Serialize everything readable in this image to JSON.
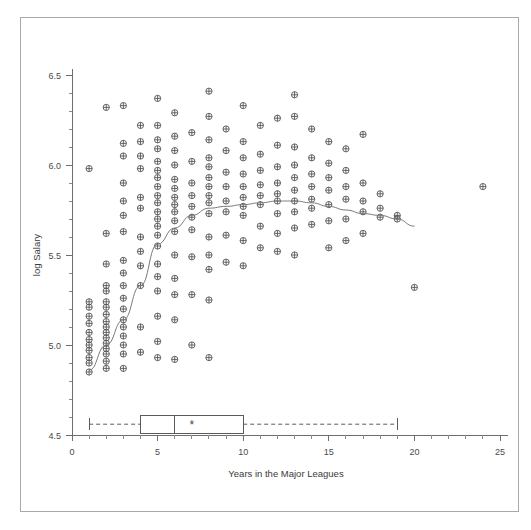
{
  "chart_data": {
    "type": "scatter",
    "title": "",
    "xlabel": "Years in the Major Leagues",
    "ylabel": "log Salary",
    "xlim": [
      0,
      25
    ],
    "ylim": [
      4.5,
      6.5
    ],
    "x_ticks": [
      0,
      5,
      10,
      15,
      20,
      25
    ],
    "x_tick_labels": [
      "0",
      "5",
      "10",
      "15",
      "20",
      "25"
    ],
    "x_minor_tick_step": 1,
    "y_ticks": [
      4.5,
      5.0,
      5.5,
      6.0,
      6.5
    ],
    "y_tick_labels": [
      "4.5",
      "5.0",
      "5.5",
      "6.0",
      "6.5"
    ],
    "y_minor_tick_step": 0.1,
    "grid": false,
    "legend": "none",
    "marker_style": "circle-with-cross",
    "points": [
      [
        1,
        5.98
      ],
      [
        1,
        5.24
      ],
      [
        1,
        5.21
      ],
      [
        1,
        5.16
      ],
      [
        1,
        5.12
      ],
      [
        1,
        5.07
      ],
      [
        1,
        5.03
      ],
      [
        1,
        5.0
      ],
      [
        1,
        4.97
      ],
      [
        1,
        4.93
      ],
      [
        1,
        4.9
      ],
      [
        1,
        4.85
      ],
      [
        2,
        6.32
      ],
      [
        2,
        5.62
      ],
      [
        2,
        5.45
      ],
      [
        2,
        5.33
      ],
      [
        2,
        5.3
      ],
      [
        2,
        5.24
      ],
      [
        2,
        5.21
      ],
      [
        2,
        5.17
      ],
      [
        2,
        5.13
      ],
      [
        2,
        5.1
      ],
      [
        2,
        5.07
      ],
      [
        2,
        5.04
      ],
      [
        2,
        5.01
      ],
      [
        2,
        4.98
      ],
      [
        2,
        4.95
      ],
      [
        2,
        4.91
      ],
      [
        2,
        4.87
      ],
      [
        3,
        6.33
      ],
      [
        3,
        6.12
      ],
      [
        3,
        6.05
      ],
      [
        3,
        5.9
      ],
      [
        3,
        5.8
      ],
      [
        3,
        5.72
      ],
      [
        3,
        5.63
      ],
      [
        3,
        5.47
      ],
      [
        3,
        5.4
      ],
      [
        3,
        5.33
      ],
      [
        3,
        5.26
      ],
      [
        3,
        5.2
      ],
      [
        3,
        5.14
      ],
      [
        3,
        5.1
      ],
      [
        3,
        5.05
      ],
      [
        3,
        5.0
      ],
      [
        3,
        4.95
      ],
      [
        3,
        4.87
      ],
      [
        4,
        6.22
      ],
      [
        4,
        6.13
      ],
      [
        4,
        6.05
      ],
      [
        4,
        5.98
      ],
      [
        4,
        5.82
      ],
      [
        4,
        5.76
      ],
      [
        4,
        5.6
      ],
      [
        4,
        5.52
      ],
      [
        4,
        5.44
      ],
      [
        4,
        5.33
      ],
      [
        4,
        5.1
      ],
      [
        4,
        4.96
      ],
      [
        5,
        6.37
      ],
      [
        5,
        6.22
      ],
      [
        5,
        6.14
      ],
      [
        5,
        6.09
      ],
      [
        5,
        6.02
      ],
      [
        5,
        5.97
      ],
      [
        5,
        5.93
      ],
      [
        5,
        5.88
      ],
      [
        5,
        5.83
      ],
      [
        5,
        5.79
      ],
      [
        5,
        5.74
      ],
      [
        5,
        5.7
      ],
      [
        5,
        5.66
      ],
      [
        5,
        5.61
      ],
      [
        5,
        5.55
      ],
      [
        5,
        5.45
      ],
      [
        5,
        5.38
      ],
      [
        5,
        5.3
      ],
      [
        5,
        5.16
      ],
      [
        5,
        5.02
      ],
      [
        5,
        4.93
      ],
      [
        6,
        6.29
      ],
      [
        6,
        6.16
      ],
      [
        6,
        6.08
      ],
      [
        6,
        6.0
      ],
      [
        6,
        5.92
      ],
      [
        6,
        5.87
      ],
      [
        6,
        5.82
      ],
      [
        6,
        5.78
      ],
      [
        6,
        5.74
      ],
      [
        6,
        5.69
      ],
      [
        6,
        5.63
      ],
      [
        6,
        5.5
      ],
      [
        6,
        5.37
      ],
      [
        6,
        5.28
      ],
      [
        6,
        5.14
      ],
      [
        6,
        4.92
      ],
      [
        7,
        6.18
      ],
      [
        7,
        6.02
      ],
      [
        7,
        5.9
      ],
      [
        7,
        5.83
      ],
      [
        7,
        5.77
      ],
      [
        7,
        5.71
      ],
      [
        7,
        5.64
      ],
      [
        7,
        5.49
      ],
      [
        7,
        5.28
      ],
      [
        7,
        5.0
      ],
      [
        8,
        6.41
      ],
      [
        8,
        6.27
      ],
      [
        8,
        6.14
      ],
      [
        8,
        6.04
      ],
      [
        8,
        5.99
      ],
      [
        8,
        5.93
      ],
      [
        8,
        5.88
      ],
      [
        8,
        5.83
      ],
      [
        8,
        5.79
      ],
      [
        8,
        5.73
      ],
      [
        8,
        5.6
      ],
      [
        8,
        5.5
      ],
      [
        8,
        5.42
      ],
      [
        8,
        5.25
      ],
      [
        8,
        4.93
      ],
      [
        9,
        6.2
      ],
      [
        9,
        6.08
      ],
      [
        9,
        5.96
      ],
      [
        9,
        5.88
      ],
      [
        9,
        5.8
      ],
      [
        9,
        5.74
      ],
      [
        9,
        5.61
      ],
      [
        9,
        5.46
      ],
      [
        10,
        6.33
      ],
      [
        10,
        6.13
      ],
      [
        10,
        6.04
      ],
      [
        10,
        5.95
      ],
      [
        10,
        5.88
      ],
      [
        10,
        5.82
      ],
      [
        10,
        5.77
      ],
      [
        10,
        5.72
      ],
      [
        10,
        5.58
      ],
      [
        10,
        5.44
      ],
      [
        11,
        6.22
      ],
      [
        11,
        6.06
      ],
      [
        11,
        5.97
      ],
      [
        11,
        5.89
      ],
      [
        11,
        5.83
      ],
      [
        11,
        5.78
      ],
      [
        11,
        5.66
      ],
      [
        11,
        5.54
      ],
      [
        12,
        6.26
      ],
      [
        12,
        6.11
      ],
      [
        12,
        5.99
      ],
      [
        12,
        5.9
      ],
      [
        12,
        5.84
      ],
      [
        12,
        5.8
      ],
      [
        12,
        5.73
      ],
      [
        12,
        5.62
      ],
      [
        12,
        5.52
      ],
      [
        13,
        6.39
      ],
      [
        13,
        6.27
      ],
      [
        13,
        6.1
      ],
      [
        13,
        6.0
      ],
      [
        13,
        5.93
      ],
      [
        13,
        5.86
      ],
      [
        13,
        5.8
      ],
      [
        13,
        5.74
      ],
      [
        13,
        5.65
      ],
      [
        13,
        5.5
      ],
      [
        14,
        6.2
      ],
      [
        14,
        6.04
      ],
      [
        14,
        5.95
      ],
      [
        14,
        5.88
      ],
      [
        14,
        5.81
      ],
      [
        14,
        5.76
      ],
      [
        14,
        5.67
      ],
      [
        15,
        6.13
      ],
      [
        15,
        6.01
      ],
      [
        15,
        5.93
      ],
      [
        15,
        5.86
      ],
      [
        15,
        5.78
      ],
      [
        15,
        5.69
      ],
      [
        15,
        5.54
      ],
      [
        16,
        6.09
      ],
      [
        16,
        5.97
      ],
      [
        16,
        5.88
      ],
      [
        16,
        5.81
      ],
      [
        16,
        5.7
      ],
      [
        16,
        5.58
      ],
      [
        17,
        6.17
      ],
      [
        17,
        5.9
      ],
      [
        17,
        5.8
      ],
      [
        17,
        5.74
      ],
      [
        17,
        5.62
      ],
      [
        18,
        5.84
      ],
      [
        18,
        5.76
      ],
      [
        18,
        5.71
      ],
      [
        19,
        5.72
      ],
      [
        19,
        5.7
      ],
      [
        20,
        5.32
      ],
      [
        24,
        5.88
      ]
    ],
    "smooth_curve": {
      "label": "lowess-smoother",
      "x": [
        1,
        2,
        3,
        4,
        5,
        6,
        7,
        8,
        9,
        10,
        11,
        12,
        13,
        14,
        15,
        16,
        17,
        18,
        19,
        20
      ],
      "y": [
        4.86,
        5.0,
        5.14,
        5.33,
        5.56,
        5.65,
        5.72,
        5.76,
        5.77,
        5.78,
        5.79,
        5.8,
        5.8,
        5.79,
        5.77,
        5.75,
        5.73,
        5.72,
        5.7,
        5.66
      ]
    },
    "boxplot": {
      "position_y": 4.56,
      "min_whisker": 1,
      "q1": 4,
      "median": 6,
      "q3": 10,
      "max_whisker": 19,
      "mean_marker": 7,
      "mean_symbol": "*"
    }
  }
}
